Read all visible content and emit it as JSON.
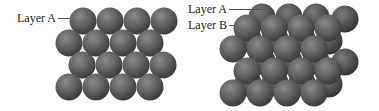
{
  "colors": {
    "sphere_light": "#8a8a8a",
    "sphere_mid": "#5f5f5f",
    "sphere_dark": "#3a3a3a",
    "sphere_back_mid": "#555555",
    "leader_line": "#555555",
    "text": "#222222"
  },
  "sphere_radius": 13.5,
  "left_diagram": {
    "label": "Layer A",
    "label_pos": {
      "x": 17,
      "y": 11
    },
    "leader": {
      "x1": 58,
      "x2": 70,
      "y": 18
    },
    "layer_a": [
      {
        "cx": 83,
        "cy": 21
      },
      {
        "cx": 110,
        "cy": 21
      },
      {
        "cx": 137,
        "cy": 21
      },
      {
        "cx": 164,
        "cy": 21
      },
      {
        "cx": 69,
        "cy": 43
      },
      {
        "cx": 96,
        "cy": 43
      },
      {
        "cx": 123,
        "cy": 43
      },
      {
        "cx": 150,
        "cy": 43
      },
      {
        "cx": 82,
        "cy": 65
      },
      {
        "cx": 109,
        "cy": 65
      },
      {
        "cx": 136,
        "cy": 65
      },
      {
        "cx": 163,
        "cy": 65
      },
      {
        "cx": 69,
        "cy": 87
      },
      {
        "cx": 96,
        "cy": 87
      },
      {
        "cx": 123,
        "cy": 87
      },
      {
        "cx": 150,
        "cy": 87
      }
    ]
  },
  "right_diagram": {
    "labels": [
      {
        "text": "Layer A",
        "x": 188,
        "y": 2,
        "leader": {
          "x1": 229,
          "x2": 263,
          "y": 9
        }
      },
      {
        "text": "Layer B",
        "x": 188,
        "y": 18,
        "leader": {
          "x1": 229,
          "x2": 236,
          "y": 25
        }
      }
    ],
    "layer_a": [
      {
        "cx": 262,
        "cy": 17
      },
      {
        "cx": 289,
        "cy": 17
      },
      {
        "cx": 316,
        "cy": 17
      },
      {
        "cx": 345,
        "cy": 19
      },
      {
        "cx": 248,
        "cy": 39
      },
      {
        "cx": 275,
        "cy": 39
      },
      {
        "cx": 302,
        "cy": 39
      },
      {
        "cx": 329,
        "cy": 41
      },
      {
        "cx": 262,
        "cy": 61
      },
      {
        "cx": 289,
        "cy": 61
      },
      {
        "cx": 316,
        "cy": 61
      },
      {
        "cx": 345,
        "cy": 62
      },
      {
        "cx": 248,
        "cy": 83
      },
      {
        "cx": 275,
        "cy": 83
      },
      {
        "cx": 302,
        "cy": 83
      },
      {
        "cx": 329,
        "cy": 84
      }
    ],
    "layer_b": [
      {
        "cx": 247,
        "cy": 28
      },
      {
        "cx": 274,
        "cy": 28
      },
      {
        "cx": 301,
        "cy": 28
      },
      {
        "cx": 328,
        "cy": 28
      },
      {
        "cx": 233,
        "cy": 49
      },
      {
        "cx": 260,
        "cy": 49
      },
      {
        "cx": 287,
        "cy": 49
      },
      {
        "cx": 314,
        "cy": 49
      },
      {
        "cx": 247,
        "cy": 71
      },
      {
        "cx": 274,
        "cy": 71
      },
      {
        "cx": 301,
        "cy": 71
      },
      {
        "cx": 328,
        "cy": 71
      },
      {
        "cx": 233,
        "cy": 93
      },
      {
        "cx": 260,
        "cy": 93
      },
      {
        "cx": 287,
        "cy": 93
      },
      {
        "cx": 314,
        "cy": 93
      }
    ]
  }
}
